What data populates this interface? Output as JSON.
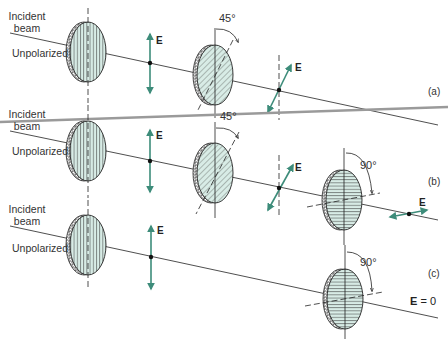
{
  "colors": {
    "e_vector": "#3d8c7a",
    "filter_fill": "#d8ece6",
    "line": "#222222",
    "divider": "#9a9a9a"
  },
  "panels": [
    {
      "id": "a",
      "label": "(a)",
      "incident_label": [
        "Incident",
        "beam"
      ],
      "unpolarized_label": "Unpolarized",
      "first_e_label": "E",
      "second_filter_angle": "45°",
      "second_e_label": "E"
    },
    {
      "id": "b",
      "label": "(b)",
      "incident_label": [
        "Incident",
        "beam"
      ],
      "unpolarized_label": "Unpolarized",
      "first_e_label": "E",
      "second_filter_angle": "45°",
      "second_e_label": "E",
      "third_filter_angle": "90°",
      "third_e_label": "E"
    },
    {
      "id": "c",
      "label": "(c)",
      "incident_label": [
        "Incident",
        "beam"
      ],
      "unpolarized_label": "Unpolarized",
      "first_e_label": "E",
      "third_filter_angle": "90°",
      "result_label_e": "E",
      "result_label_rest": "= 0"
    }
  ]
}
